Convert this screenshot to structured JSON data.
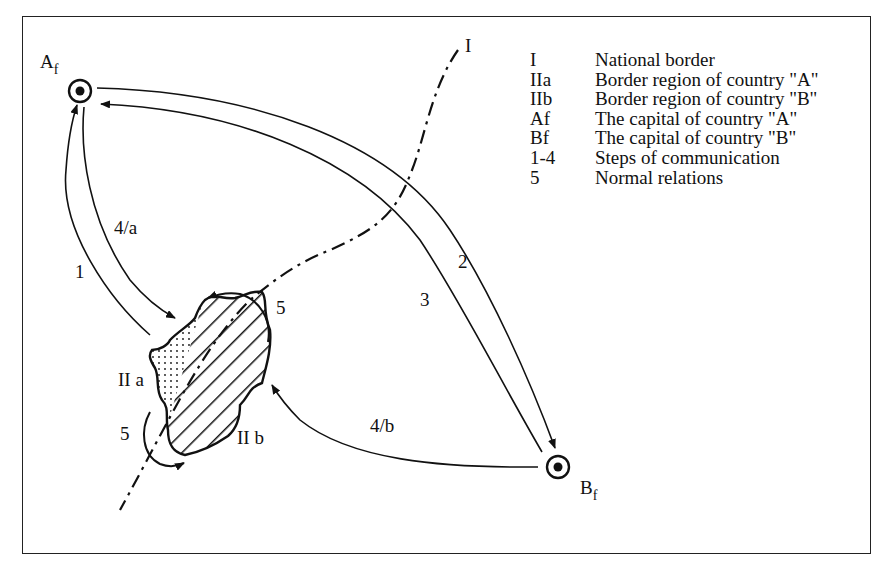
{
  "diagram": {
    "nodes": {
      "af": {
        "label": "A",
        "sub": "f"
      },
      "bf": {
        "label": "B",
        "sub": "f"
      },
      "border_I": {
        "label": "I"
      },
      "region_IIa": {
        "label": "II a"
      },
      "region_IIb": {
        "label": "II b"
      }
    },
    "edge_labels": {
      "step_1": "1",
      "step_2": "2",
      "step_3": "3",
      "step_4a": "4/a",
      "step_4b": "4/b",
      "normal_top": "5",
      "normal_bottom": "5"
    }
  },
  "legend": {
    "items": [
      {
        "key": "I",
        "text": "National border"
      },
      {
        "key": "IIa",
        "text": "Border region of country \"A\""
      },
      {
        "key": "IIb",
        "text": "Border region of country \"B\""
      },
      {
        "key": "Af",
        "text": "The capital of country \"A\""
      },
      {
        "key": "Bf",
        "text": "The capital of country \"B\""
      },
      {
        "key": "1-4",
        "text": "Steps of communication"
      },
      {
        "key": "5",
        "text": "Normal relations"
      }
    ]
  }
}
